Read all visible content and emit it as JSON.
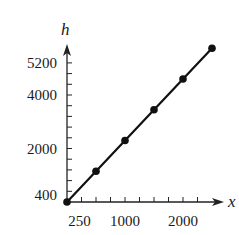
{
  "chart_data": {
    "type": "line",
    "title": "",
    "xlabel": "x",
    "ylabel": "h",
    "x": [
      0,
      500,
      1000,
      1500,
      2000,
      2500
    ],
    "series": [
      {
        "name": "h",
        "values": [
          0,
          1150,
          2300,
          3450,
          4600,
          5750
        ],
        "markers": true
      }
    ],
    "x_ticks": {
      "step": 250,
      "count": 9
    },
    "y_ticks": {
      "step": 400,
      "count": 13
    },
    "x_tick_labels": [
      {
        "value": 250,
        "label": "250"
      },
      {
        "value": 1000,
        "label": "1000"
      },
      {
        "value": 2000,
        "label": "2000"
      }
    ],
    "y_tick_labels": [
      {
        "value": 400,
        "label": "400"
      },
      {
        "value": 2000,
        "label": "2000"
      },
      {
        "value": 4000,
        "label": "4000"
      },
      {
        "value": 5200,
        "label": "5200"
      }
    ],
    "xlim": [
      0,
      2700
    ],
    "ylim": [
      0,
      5900
    ],
    "grid": false,
    "legend": "none",
    "colors": {
      "line": "#111111",
      "axis": "#222222",
      "text": "#1a1a1a"
    }
  }
}
